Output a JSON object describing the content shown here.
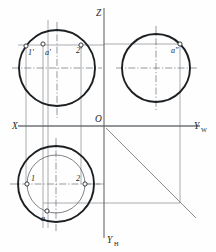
{
  "drawing": {
    "title": "Orthographic projection of a sphere with point A",
    "background_color": "#fefefe",
    "outline_color": "#1d2023",
    "axis_color": "#54585c",
    "projection_color": "#7d8186",
    "centerline_color": "#6b6f73"
  },
  "axes": {
    "x_label": "X",
    "z_label": "Z",
    "origin_label": "O",
    "yw_label": "Y",
    "yw_subscript": "W",
    "yh_label": "Y",
    "yh_subscript": "H",
    "origin": {
      "x": 104,
      "y": 126
    },
    "x_axis": {
      "x1": 18,
      "y1": 126,
      "x2": 104,
      "y2": 126
    },
    "z_axis": {
      "x1": 104,
      "y1": 8,
      "x2": 104,
      "y2": 126
    },
    "yw_axis": {
      "x1": 104,
      "y1": 126,
      "x2": 200,
      "y2": 126
    },
    "yh_axis": {
      "x1": 104,
      "y1": 126,
      "x2": 104,
      "y2": 238
    }
  },
  "mitre": {
    "name": "45-degree-mitre-line",
    "x1": 106,
    "y1": 128,
    "x2": 196,
    "y2": 218,
    "angle_degrees": 45
  },
  "views": {
    "front": {
      "name": "front-view-V",
      "center": {
        "x": 57,
        "y": 68
      },
      "radius": 38,
      "points": [
        {
          "label": "1'",
          "marker_x": 26,
          "marker_y": 46,
          "label_x": 28,
          "label_y": 55
        },
        {
          "label": "a'",
          "marker_x": 43,
          "marker_y": 44,
          "label_x": 45,
          "label_y": 55
        },
        {
          "label": "2'",
          "marker_x": 81,
          "marker_y": 45,
          "label_x": 76,
          "label_y": 53
        }
      ]
    },
    "side": {
      "name": "side-view-W",
      "center": {
        "x": 156,
        "y": 68
      },
      "radius": 34,
      "points": [
        {
          "label": "a″",
          "marker_x": 180,
          "marker_y": 44,
          "label_x": 171,
          "label_y": 53
        }
      ]
    },
    "top": {
      "name": "top-view-H",
      "center": {
        "x": 56,
        "y": 184
      },
      "outer_radius": 38,
      "inner_radius": 29,
      "points": [
        {
          "label": "1",
          "marker_x": 27,
          "marker_y": 184,
          "label_x": 31,
          "label_y": 181
        },
        {
          "label": "2",
          "marker_x": 85,
          "marker_y": 184,
          "label_x": 76,
          "label_y": 181
        },
        {
          "label": "a",
          "marker_x": 47,
          "marker_y": 211,
          "label_x": 41,
          "label_y": 221
        }
      ]
    }
  },
  "projection_lines": {
    "vertical_x": [
      26,
      43,
      48,
      57,
      81
    ],
    "horizontal_y": [
      45,
      126,
      184,
      203
    ],
    "side_vertical_x": [
      180,
      156
    ],
    "notes": "thin construction lines linking the three orthographic views"
  }
}
